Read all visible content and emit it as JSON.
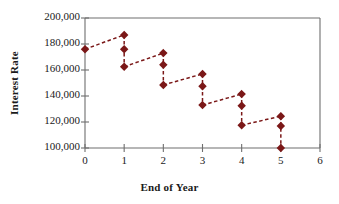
{
  "chart_data": {
    "type": "scatter",
    "title": "",
    "xlabel": "End of Year",
    "ylabel": "Interest Rate",
    "xlim": [
      0,
      6
    ],
    "ylim": [
      100000,
      200000
    ],
    "xticks": [
      "0",
      "1",
      "2",
      "3",
      "4",
      "5",
      "6"
    ],
    "xtick_values": [
      0,
      1,
      2,
      3,
      4,
      5,
      6
    ],
    "yticks": [
      "100,000",
      "120,000",
      "140,000",
      "160,000",
      "180,000",
      "200,000"
    ],
    "ytick_values": [
      100000,
      120000,
      140000,
      160000,
      180000,
      200000
    ],
    "grid": false,
    "legend": null,
    "marker_color": "#7B1818",
    "line_color": "#7B1818",
    "line_style": "dashed",
    "marker_style": "diamond",
    "series": [
      {
        "name": "Interest Rate",
        "points": [
          {
            "x": 0,
            "y": 176000
          },
          {
            "x": 1,
            "y": 187000
          },
          {
            "x": 1,
            "y": 176000
          },
          {
            "x": 1,
            "y": 162500
          },
          {
            "x": 2,
            "y": 173000
          },
          {
            "x": 2,
            "y": 164000
          },
          {
            "x": 2,
            "y": 148500
          },
          {
            "x": 3,
            "y": 157000
          },
          {
            "x": 3,
            "y": 147500
          },
          {
            "x": 3,
            "y": 133000
          },
          {
            "x": 4,
            "y": 141500
          },
          {
            "x": 4,
            "y": 132500
          },
          {
            "x": 4,
            "y": 117500
          },
          {
            "x": 5,
            "y": 124500
          },
          {
            "x": 5,
            "y": 117000
          },
          {
            "x": 5,
            "y": 100000
          }
        ]
      }
    ],
    "segments": [
      {
        "from": {
          "x": 0,
          "y": 176000
        },
        "to": {
          "x": 1,
          "y": 187000
        },
        "kind": "rise"
      },
      {
        "from": {
          "x": 1,
          "y": 187000
        },
        "to": {
          "x": 1,
          "y": 162500
        },
        "kind": "drop"
      },
      {
        "from": {
          "x": 1,
          "y": 162500
        },
        "to": {
          "x": 2,
          "y": 173000
        },
        "kind": "rise"
      },
      {
        "from": {
          "x": 2,
          "y": 173000
        },
        "to": {
          "x": 2,
          "y": 148500
        },
        "kind": "drop"
      },
      {
        "from": {
          "x": 2,
          "y": 148500
        },
        "to": {
          "x": 3,
          "y": 157000
        },
        "kind": "rise"
      },
      {
        "from": {
          "x": 3,
          "y": 157000
        },
        "to": {
          "x": 3,
          "y": 133000
        },
        "kind": "drop"
      },
      {
        "from": {
          "x": 3,
          "y": 133000
        },
        "to": {
          "x": 4,
          "y": 141500
        },
        "kind": "rise"
      },
      {
        "from": {
          "x": 4,
          "y": 141500
        },
        "to": {
          "x": 4,
          "y": 117500
        },
        "kind": "drop"
      },
      {
        "from": {
          "x": 4,
          "y": 117500
        },
        "to": {
          "x": 5,
          "y": 124500
        },
        "kind": "rise"
      },
      {
        "from": {
          "x": 5,
          "y": 124500
        },
        "to": {
          "x": 5,
          "y": 100000
        },
        "kind": "drop"
      }
    ]
  },
  "axes": {
    "frame_color": "#6e6e6e",
    "text_color": "#1a1a1a"
  }
}
